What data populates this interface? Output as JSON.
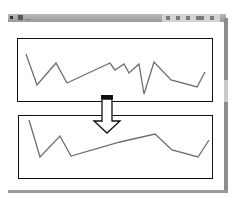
{
  "window": {
    "title": "…",
    "titlebar_buttons": [
      "minimize-button",
      "maximize-button",
      "close-button"
    ]
  },
  "diagram": {
    "top_panel": {
      "label": "original-series",
      "points": [
        [
          26,
          54
        ],
        [
          37,
          85
        ],
        [
          56,
          63
        ],
        [
          67,
          83
        ],
        [
          110,
          63
        ],
        [
          115,
          70
        ],
        [
          124,
          64
        ],
        [
          129,
          73
        ],
        [
          139,
          64
        ],
        [
          144,
          94
        ],
        [
          154,
          62
        ],
        [
          171,
          80
        ],
        [
          197,
          87
        ],
        [
          205,
          72
        ]
      ]
    },
    "arrow": {
      "direction": "down",
      "label": "transform-arrow"
    },
    "bottom_panel": {
      "label": "smoothed-series",
      "points": [
        [
          29,
          120
        ],
        [
          40,
          157
        ],
        [
          60,
          136
        ],
        [
          71,
          156
        ],
        [
          120,
          142
        ],
        [
          155,
          134
        ],
        [
          172,
          150
        ],
        [
          198,
          157
        ],
        [
          209,
          140
        ]
      ]
    },
    "colors": {
      "line": "#6e6e6e",
      "border": "#111111",
      "titlebar": "#a8a8a8"
    }
  }
}
